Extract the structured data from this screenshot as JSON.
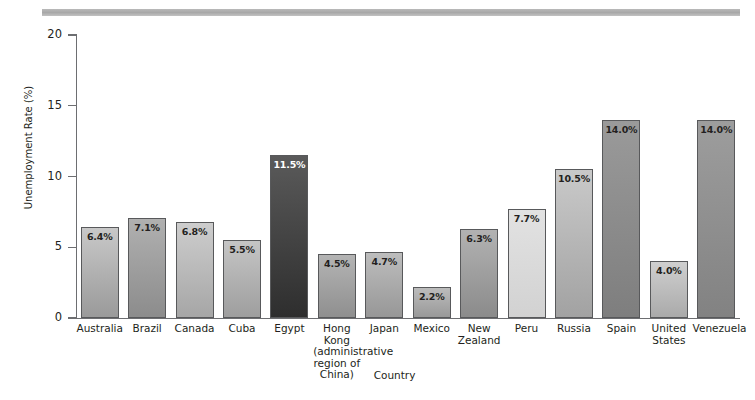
{
  "chart_data": {
    "type": "bar",
    "title": "",
    "xlabel": "Country",
    "ylabel": "Unemployment Rate (%)",
    "ylim": [
      0,
      20
    ],
    "yticks": [
      0,
      5,
      10,
      15,
      20
    ],
    "ytick_labels": [
      "0",
      "5",
      "10",
      "15",
      "20"
    ],
    "grid": false,
    "legend": "none",
    "categories": [
      "Australia",
      "Brazil",
      "Canada",
      "Cuba",
      "Egypt",
      "Hong Kong\n(administrative\nregion of China)",
      "Japan",
      "Mexico",
      "New\nZealand",
      "Peru",
      "Russia",
      "Spain",
      "United\nStates",
      "Venezuela"
    ],
    "values": [
      6.4,
      7.1,
      6.8,
      5.5,
      11.5,
      4.5,
      4.7,
      2.2,
      6.3,
      7.7,
      10.5,
      14.0,
      4.0,
      14.0
    ],
    "value_labels": [
      "6.4%",
      "7.1%",
      "6.8%",
      "5.5%",
      "11.5%",
      "4.5%",
      "4.7%",
      "2.2%",
      "6.3%",
      "7.7%",
      "10.5%",
      "14.0%",
      "4.0%",
      "14.0%"
    ],
    "bar_colors_top": [
      "#c8c8c8",
      "#b0b0b0",
      "#cdcdcd",
      "#c5c5c5",
      "#5a5a5a",
      "#b4b4b4",
      "#bdbdbd",
      "#bcbcbc",
      "#b2b2b2",
      "#e2e2e2",
      "#c9c9c9",
      "#9a9a9a",
      "#cfcfcf",
      "#9d9d9d"
    ],
    "bar_colors_bottom": [
      "#9a9a9a",
      "#8c8c8c",
      "#a6a6a6",
      "#9e9e9e",
      "#2e2e2e",
      "#8f8f8f",
      "#979797",
      "#999999",
      "#8b8b8b",
      "#d2d2d2",
      "#a2a2a2",
      "#7e7e7e",
      "#aaaaaa",
      "#828282"
    ],
    "label_is_light": [
      false,
      false,
      false,
      false,
      true,
      false,
      false,
      false,
      false,
      false,
      false,
      false,
      false,
      false
    ]
  },
  "axis": {
    "line_color": "#6d6e71",
    "text_color": "#231f20"
  },
  "decor": {
    "top_rule_color": "#b3b3b3"
  }
}
